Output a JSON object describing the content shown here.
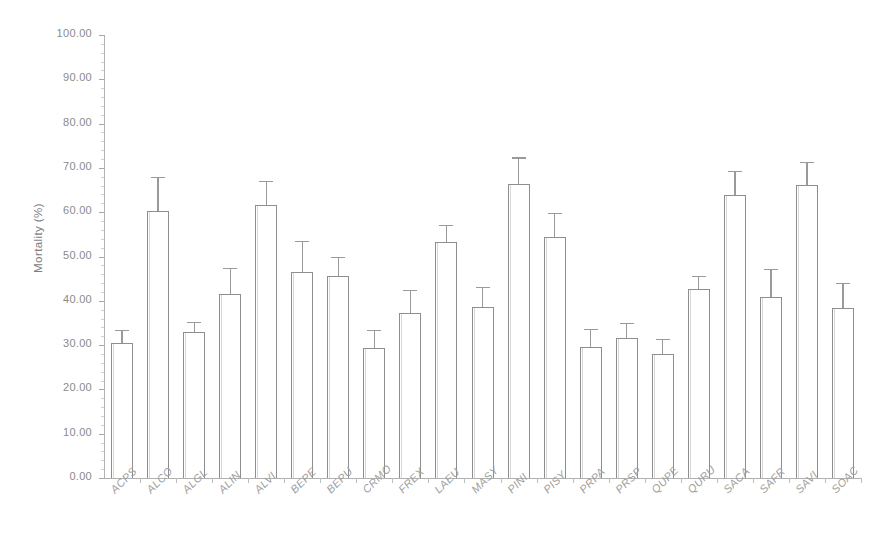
{
  "chart_data": {
    "type": "bar",
    "title": "",
    "xlabel": "",
    "ylabel": "Mortality (%)",
    "ylim": [
      0,
      100
    ],
    "ytick_step": 10,
    "ytick_labels": [
      "100.00",
      "90.00",
      "80.00",
      "70.00",
      "60.00",
      "50.00",
      "40.00",
      "30.00",
      "20.00",
      "10.00",
      "0.00"
    ],
    "ytick_values": [
      100,
      90,
      80,
      70,
      60,
      50,
      40,
      30,
      20,
      10,
      0
    ],
    "grid": false,
    "legend": false,
    "error_bars": "upper-and-lower",
    "bar_fill": "#ffffff",
    "bar_outline": "#8e8e8e",
    "axis_color": "#b0b0b0",
    "text_color": "#8d8d8d",
    "categories": [
      "ACPS",
      "ALCO",
      "ALGL",
      "ALIN",
      "ALVI",
      "BEPE",
      "BEPU",
      "CRMO",
      "FREX",
      "LAEU",
      "MASY",
      "PINI",
      "PISY",
      "PRPA",
      "PRSP",
      "QUPE",
      "QURU",
      "SACA",
      "SAFR",
      "SAVI",
      "SOAC"
    ],
    "values": [
      30.5,
      60.3,
      33.0,
      41.6,
      61.7,
      46.5,
      45.7,
      29.3,
      37.3,
      53.2,
      38.5,
      66.4,
      54.5,
      29.6,
      31.6,
      27.9,
      42.7,
      63.8,
      40.9,
      66.1,
      38.4
    ],
    "errors": [
      3.0,
      7.7,
      2.3,
      5.8,
      5.3,
      7.1,
      4.3,
      4.1,
      5.2,
      4.0,
      4.6,
      6.0,
      5.3,
      4.1,
      3.5,
      3.5,
      3.0,
      5.6,
      6.3,
      5.3,
      5.6
    ]
  }
}
